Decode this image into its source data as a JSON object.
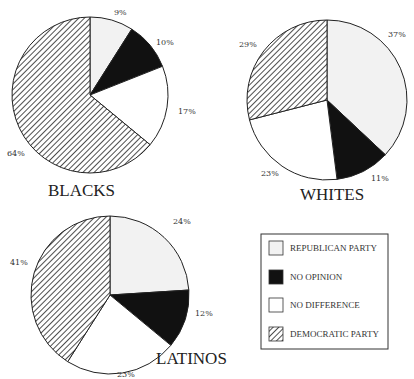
{
  "chart_data": [
    {
      "type": "pie",
      "title": "BLACKS",
      "categories": [
        "REPUBLICAN PARTY",
        "NO OPINION",
        "NO DIFFERENCE",
        "DEMOCRATIC PARTY"
      ],
      "values": [
        9,
        10,
        17,
        64
      ],
      "labels": [
        "9%",
        "10%",
        "17%",
        "64%"
      ]
    },
    {
      "type": "pie",
      "title": "WHITES",
      "categories": [
        "REPUBLICAN PARTY",
        "NO OPINION",
        "NO DIFFERENCE",
        "DEMOCRATIC PARTY"
      ],
      "values": [
        37,
        11,
        23,
        29
      ],
      "labels": [
        "37%",
        "11%",
        "23%",
        "29%"
      ]
    },
    {
      "type": "pie",
      "title": "LATINOS",
      "categories": [
        "REPUBLICAN PARTY",
        "NO OPINION",
        "NO DIFFERENCE",
        "DEMOCRATIC PARTY"
      ],
      "values": [
        24,
        12,
        23,
        41
      ],
      "labels": [
        "24%",
        "12%",
        "23%",
        "41%"
      ]
    }
  ],
  "legend": {
    "items": [
      {
        "label": "REPUBLICAN PARTY",
        "fill": "#f2f2f2"
      },
      {
        "label": "NO OPINION",
        "fill": "#111111"
      },
      {
        "label": "NO DIFFERENCE",
        "fill": "#ffffff"
      },
      {
        "label": "DEMOCRATIC PARTY",
        "fill": "hatch"
      }
    ]
  },
  "colors": {
    "republican": "#f2f2f2",
    "no_opinion": "#111111",
    "no_difference": "#ffffff",
    "democratic_hatch": "#222222"
  }
}
